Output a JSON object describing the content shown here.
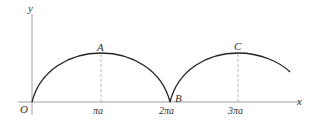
{
  "diagram": {
    "axes": {
      "x_label": "x",
      "y_label": "y",
      "origin_label": "O"
    },
    "ticks": [
      "πa",
      "2πa",
      "3πa"
    ],
    "points": [
      {
        "label": "A",
        "at": "πa"
      },
      {
        "label": "B",
        "at": "2πa"
      },
      {
        "label": "C",
        "at": "3πa"
      }
    ]
  }
}
